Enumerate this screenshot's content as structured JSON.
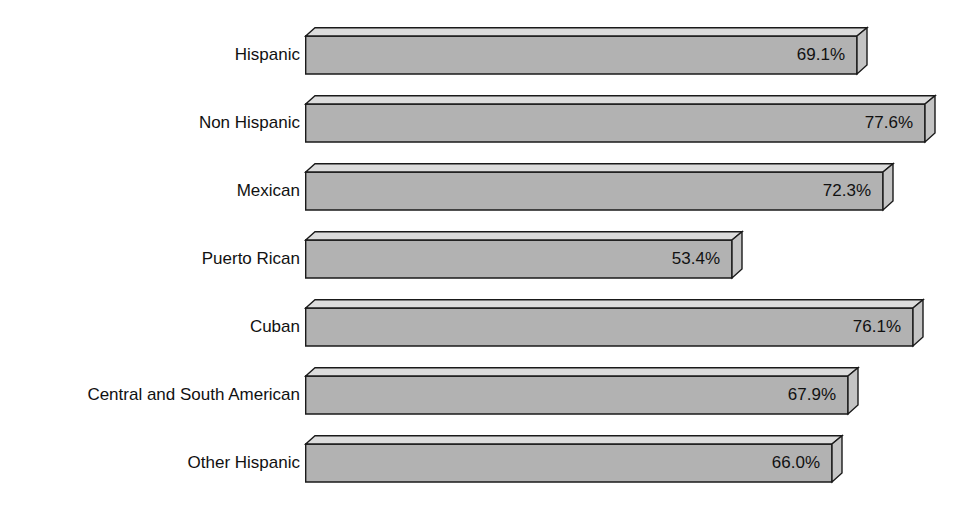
{
  "chart_data": {
    "type": "bar",
    "orientation": "horizontal",
    "title": "",
    "xlabel": "",
    "ylabel": "",
    "grid": false,
    "legend": false,
    "axis_visible": false,
    "value_suffix": "%",
    "xlim": [
      0,
      77.6
    ],
    "categories": [
      "Hispanic",
      "Non Hispanic",
      "Mexican",
      "Puerto Rican",
      "Cuban",
      "Central and South American",
      "Other Hispanic"
    ],
    "values": [
      69.1,
      77.6,
      72.3,
      53.4,
      76.1,
      67.9,
      66.0
    ],
    "value_labels": [
      "69.1%",
      "77.6%",
      "72.3%",
      "53.4%",
      "76.1%",
      "67.9%",
      "66.0%"
    ],
    "bars": [
      {
        "category": "Hispanic",
        "value": 69.1,
        "label": "69.1%"
      },
      {
        "category": "Non Hispanic",
        "value": 77.6,
        "label": "77.6%"
      },
      {
        "category": "Mexican",
        "value": 72.3,
        "label": "72.3%"
      },
      {
        "category": "Puerto Rican",
        "value": 53.4,
        "label": "53.4%"
      },
      {
        "category": "Cuban",
        "value": 76.1,
        "label": "76.1%"
      },
      {
        "category": "Central and South American",
        "value": 67.9,
        "label": "67.9%"
      },
      {
        "category": "Other Hispanic",
        "value": 66.0,
        "label": "66.0%"
      }
    ],
    "style": {
      "background": "#ffffff",
      "bar_front": "#b2b2b2",
      "bar_top": "#dcdcdc",
      "bar_side": "#c4c4c4",
      "bar_outline": "#1a1a1a",
      "text_color": "#111111"
    }
  }
}
